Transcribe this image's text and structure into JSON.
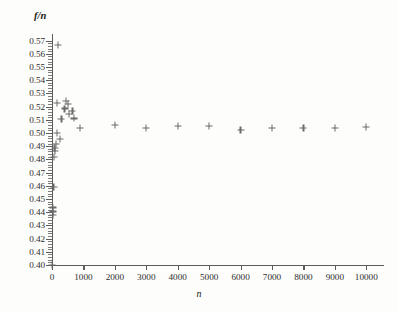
{
  "figure": {
    "ytitle": "f/n",
    "xtitle": "n"
  },
  "chart_data": {
    "type": "scatter",
    "title": "",
    "xlabel": "n",
    "ylabel": "f/n",
    "xlim": [
      0,
      10500
    ],
    "ylim": [
      0.4,
      0.575
    ],
    "grid": false,
    "legend": null,
    "marker": "plus",
    "marker_color": "#6b6b6b",
    "xticks": [
      0,
      1000,
      2000,
      3000,
      4000,
      5000,
      6000,
      7000,
      8000,
      9000,
      10000
    ],
    "xticklabels": [
      "0",
      "1000",
      "2000",
      "3000",
      "4000",
      "5000",
      "6000",
      "7000",
      "8000",
      "9000",
      "10000"
    ],
    "yticks": [
      0.4,
      0.41,
      0.42,
      0.43,
      0.44,
      0.45,
      0.46,
      0.47,
      0.48,
      0.49,
      0.5,
      0.51,
      0.52,
      0.53,
      0.54,
      0.55,
      0.56,
      0.57
    ],
    "yticklabels": [
      "0.40",
      "0.41",
      "0.42",
      "0.43",
      "0.44",
      "0.45",
      "0.46",
      "0.47",
      "0.48",
      "0.49",
      "0.50",
      "0.51",
      "0.52",
      "0.53",
      "0.54",
      "0.55",
      "0.56",
      "0.57"
    ],
    "points": [
      {
        "x": 10,
        "y": 0.4
      },
      {
        "x": 20,
        "y": 0.4405
      },
      {
        "x": 30,
        "y": 0.4435
      },
      {
        "x": 40,
        "y": 0.438
      },
      {
        "x": 50,
        "y": 0.459
      },
      {
        "x": 60,
        "y": 0.482
      },
      {
        "x": 80,
        "y": 0.4885
      },
      {
        "x": 100,
        "y": 0.4865
      },
      {
        "x": 120,
        "y": 0.4915
      },
      {
        "x": 150,
        "y": 0.5
      },
      {
        "x": 170,
        "y": 0.523
      },
      {
        "x": 200,
        "y": 0.5665
      },
      {
        "x": 250,
        "y": 0.4955
      },
      {
        "x": 300,
        "y": 0.5105
      },
      {
        "x": 400,
        "y": 0.5185
      },
      {
        "x": 450,
        "y": 0.524
      },
      {
        "x": 500,
        "y": 0.522
      },
      {
        "x": 550,
        "y": 0.5145
      },
      {
        "x": 650,
        "y": 0.5165
      },
      {
        "x": 700,
        "y": 0.511
      },
      {
        "x": 900,
        "y": 0.5035
      },
      {
        "x": 2000,
        "y": 0.506
      },
      {
        "x": 3000,
        "y": 0.504
      },
      {
        "x": 4000,
        "y": 0.5055
      },
      {
        "x": 5000,
        "y": 0.505
      },
      {
        "x": 6000,
        "y": 0.502
      },
      {
        "x": 7000,
        "y": 0.5035
      },
      {
        "x": 8000,
        "y": 0.504
      },
      {
        "x": 9000,
        "y": 0.5035
      },
      {
        "x": 10000,
        "y": 0.5045
      }
    ]
  }
}
